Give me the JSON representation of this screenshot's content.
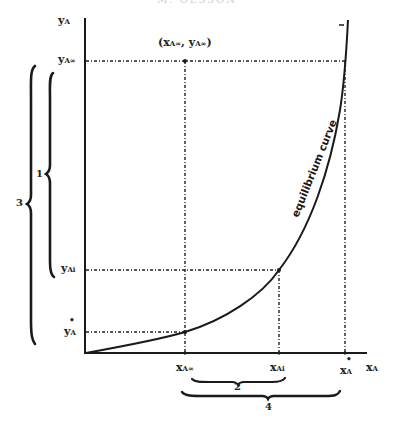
{
  "header": {
    "running_title": "M. OLSSON"
  },
  "axes": {
    "y_label": "y",
    "y_label_sub": "A",
    "x_label": "x",
    "x_label_sub": "A"
  },
  "y_ticks": [
    {
      "id": "yAinf",
      "base": "y",
      "sub": "A∞",
      "marked": false
    },
    {
      "id": "yAi",
      "base": "y",
      "sub": "Ai",
      "marked": false
    },
    {
      "id": "yAstar",
      "base": "y",
      "sub": "A",
      "marked": true
    }
  ],
  "x_ticks": [
    {
      "id": "xAinf",
      "base": "x",
      "sub": "A∞",
      "marked": false
    },
    {
      "id": "xAi",
      "base": "x",
      "sub": "Ai",
      "marked": false
    },
    {
      "id": "xAstar",
      "base": "x",
      "sub": "A",
      "marked": true
    }
  ],
  "point_label": "(x",
  "point_label_parts": {
    "x": "x",
    "x_sub": "A∞",
    "sep": ", ",
    "y": "y",
    "y_sub": "A∞",
    "open": "(",
    "close": ")"
  },
  "curve_label": "equilibrium curve",
  "top_tick": "–",
  "braces": {
    "b1": "1",
    "b2": "2",
    "b3": "3",
    "b4": "4"
  },
  "colors": {
    "ink": "#1a1a1a",
    "paper": "#ffffff"
  }
}
